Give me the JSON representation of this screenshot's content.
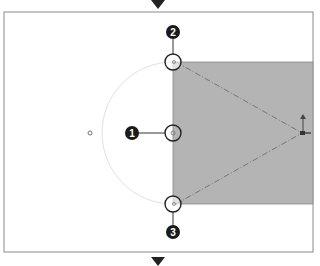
{
  "diagram": {
    "frame": {
      "x": 4,
      "y": 12,
      "w": 309,
      "h": 240,
      "stroke": "#8a8a8a"
    },
    "shaded_region": {
      "x": 173,
      "y": 62,
      "w": 140,
      "h": 142,
      "fill": "#b4b4b4"
    },
    "arc": {
      "cx": 173,
      "cy": 133,
      "r": 71,
      "stroke": "#e4e4e4"
    },
    "arrows": {
      "top": {
        "x": 158,
        "y": 0
      },
      "bottom": {
        "x": 158,
        "y": 255
      }
    },
    "callouts": [
      {
        "label": "1",
        "badge_x": 132,
        "badge_y": 133,
        "target_x": 173,
        "target_y": 133
      },
      {
        "label": "2",
        "badge_x": 173,
        "badge_y": 32,
        "target_x": 173,
        "target_y": 62
      },
      {
        "label": "3",
        "badge_x": 173,
        "badge_y": 232,
        "target_x": 173,
        "target_y": 204
      }
    ],
    "colors": {
      "badge": "#1a1a1a",
      "badge_text": "#ffffff",
      "line": "#333333",
      "dash": "#7a7a7a"
    }
  }
}
